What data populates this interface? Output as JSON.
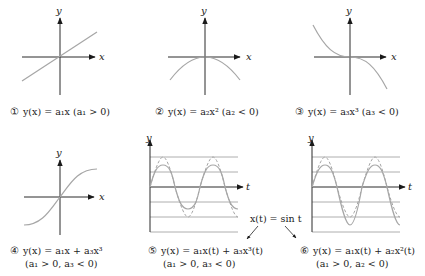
{
  "panels": [
    {
      "id": 1,
      "marker": "①",
      "caption": "y(x) = a₁x (a₁ > 0)",
      "x_label": "x",
      "y_label": "y",
      "curve": "linear, positive slope"
    },
    {
      "id": 2,
      "marker": "②",
      "caption": "y(x) = a₂x² (a₂ < 0)",
      "x_label": "x",
      "y_label": "y",
      "curve": "downward parabola"
    },
    {
      "id": 3,
      "marker": "③",
      "caption": "y(x) = a₃x³ (a₃ < 0)",
      "x_label": "x",
      "y_label": "y",
      "curve": "negative cubic"
    },
    {
      "id": 4,
      "marker": "④",
      "caption": "y(x) = a₁x + a₃x³",
      "caption2": "(a₁ > 0, a₃ < 0)",
      "x_label": "x",
      "y_label": "y",
      "curve": "saturating S-curve"
    },
    {
      "id": 5,
      "marker": "⑤",
      "caption": "y(x) = a₁x(t) + a₃x³(t)",
      "caption2": "(a₁ > 0, a₃ < 0)",
      "x_label": "t",
      "y_label": "y",
      "curve": "compressed sine (solid) vs sine (dashed)"
    },
    {
      "id": 6,
      "marker": "⑥",
      "caption": "y(x) = a₁x(t) + a₂x²(t)",
      "caption2": "(a₁ > 0, a₂ < 0)",
      "x_label": "t",
      "y_label": "y",
      "curve": "asymmetric sine (solid) vs sine (dashed)"
    }
  ],
  "input_annotation": "x(t) = sin t",
  "colors": {
    "axis": "#2b2b2b",
    "curve": "#a6a6a6",
    "grid": "#9a9a9a",
    "background": "#ffffff"
  }
}
